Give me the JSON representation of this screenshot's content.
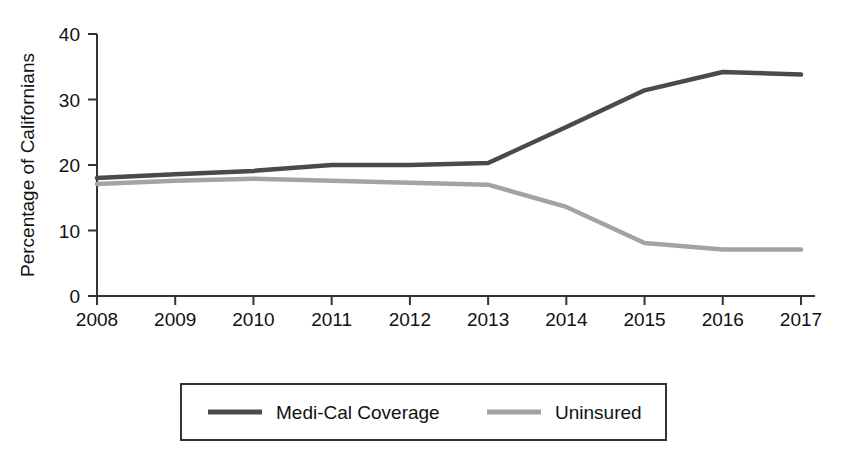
{
  "chart_data": {
    "type": "line",
    "title": "",
    "subtitle": "",
    "xlabel": "",
    "ylabel": "Percentage of Californians",
    "x": [
      2008,
      2009,
      2010,
      2011,
      2012,
      2013,
      2014,
      2015,
      2016,
      2017
    ],
    "categories": [
      "2008",
      "2009",
      "2010",
      "2011",
      "2012",
      "2013",
      "2014",
      "2015",
      "2016",
      "2017"
    ],
    "xtick_labels": [
      "2008",
      "2009",
      "2010",
      "2011",
      "2012",
      "2013",
      "2014",
      "2015",
      "2016",
      "2017"
    ],
    "ytick_labels": [
      "0",
      "10",
      "20",
      "30",
      "40"
    ],
    "ytick_values": [
      0,
      10,
      20,
      30,
      40
    ],
    "ylim": [
      0,
      40
    ],
    "xlim": [
      2008,
      2017
    ],
    "grid": false,
    "legend_position": "bottom",
    "series": [
      {
        "name": "Medi-Cal Coverage",
        "color": "#4a4a4a",
        "values": [
          18.0,
          18.6,
          19.1,
          20.0,
          20.0,
          20.3,
          25.8,
          31.4,
          34.2,
          33.8
        ]
      },
      {
        "name": "Uninsured",
        "color": "#a3a3a3",
        "values": [
          17.1,
          17.6,
          17.9,
          17.6,
          17.3,
          17.0,
          13.6,
          8.1,
          7.1,
          7.1
        ]
      }
    ]
  },
  "axis": {
    "y_axis_label": "Percentage of Californians"
  },
  "legend": {
    "entries": [
      {
        "label": "Medi-Cal Coverage",
        "color": "#4a4a4a"
      },
      {
        "label": "Uninsured",
        "color": "#a3a3a3"
      }
    ]
  }
}
